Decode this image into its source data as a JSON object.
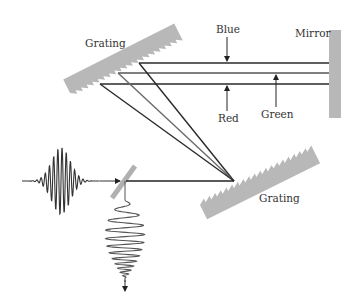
{
  "diagram": {
    "labels": {
      "grating_top": "Grating",
      "grating_bottom": "Grating",
      "mirror": "Mirror",
      "blue": "Blue",
      "green": "Green",
      "red": "Red"
    },
    "components": [
      {
        "name": "Grating",
        "position": "upper-left"
      },
      {
        "name": "Grating",
        "position": "lower-right"
      },
      {
        "name": "Mirror",
        "position": "right"
      },
      {
        "name": "Beam splitter",
        "position": "lower-left"
      }
    ],
    "beams": [
      {
        "name": "Blue",
        "role": "top beam to mirror"
      },
      {
        "name": "Green",
        "role": "middle beam to mirror"
      },
      {
        "name": "Red",
        "role": "bottom beam to mirror"
      }
    ],
    "pulses": [
      {
        "name": "input pulse",
        "type": "short transform-limited"
      },
      {
        "name": "output pulse",
        "type": "chirped / stretched"
      }
    ],
    "colors": {
      "grating": "#b3b3b3",
      "mirror": "#b3b3b3",
      "beam_dark": "#2a2a2a",
      "beam_mid": "#6a6a6a",
      "text": "#333333"
    }
  }
}
